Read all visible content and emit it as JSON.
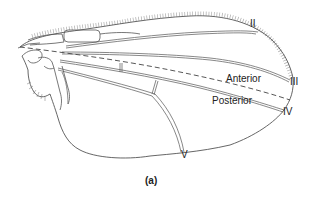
{
  "figure": {
    "caption": "(a)",
    "regions": {
      "anterior": "Anterior",
      "posterior": "Posterior"
    },
    "veins": [
      {
        "id": "vein-2",
        "label": "II"
      },
      {
        "id": "vein-3",
        "label": "III"
      },
      {
        "id": "vein-4",
        "label": "IV"
      },
      {
        "id": "vein-5",
        "label": "V"
      }
    ],
    "colors": {
      "line": "#555555",
      "text": "#222222",
      "background": "#ffffff"
    }
  }
}
